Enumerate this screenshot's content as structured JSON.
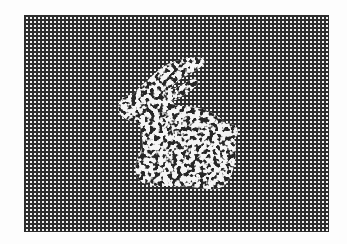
{
  "image": {
    "description": "Halftone checker grid with a noisy bunny silhouette",
    "width": 347,
    "height": 244,
    "grid": {
      "left": 24,
      "top": 15,
      "width": 305,
      "height": 217,
      "period_px": 4,
      "line_color": "#2e2e2e",
      "cell_color": "#f2f2f2"
    },
    "subject": {
      "label": "bunny",
      "fill_light": "#f4f4f4",
      "fill_dark": "#262626"
    },
    "background_color": "#fdfdfd"
  }
}
